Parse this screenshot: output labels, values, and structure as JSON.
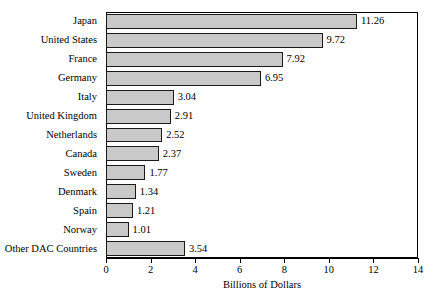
{
  "chart_data": {
    "type": "bar",
    "orientation": "horizontal",
    "title": "",
    "xlabel": "Billions of Dollars",
    "ylabel": "",
    "xlim": [
      0,
      14
    ],
    "xticks": [
      0,
      2,
      4,
      6,
      8,
      10,
      12,
      14
    ],
    "xtick_labels": [
      "0",
      "2",
      "4",
      "6",
      "8",
      "10",
      "12",
      "14"
    ],
    "grid": false,
    "legend": null,
    "categories": [
      "Japan",
      "United States",
      "France",
      "Germany",
      "Italy",
      "United Kingdom",
      "Netherlands",
      "Canada",
      "Sweden",
      "Denmark",
      "Spain",
      "Norway",
      "Other DAC Countries"
    ],
    "values": [
      11.26,
      9.72,
      7.92,
      6.95,
      3.04,
      2.91,
      2.52,
      2.37,
      1.77,
      1.34,
      1.21,
      1.01,
      3.54
    ],
    "value_labels": [
      "11.26",
      "9.72",
      "7.92",
      "6.95",
      "3.04",
      "2.91",
      "2.52",
      "2.37",
      "1.77",
      "1.34",
      "1.21",
      "1.01",
      "3.54"
    ],
    "bar_fill_color": "#c9c9c9",
    "bar_edge_color": "#1a1a1a",
    "axis_color": "#000000",
    "background_color": "#ffffff"
  }
}
